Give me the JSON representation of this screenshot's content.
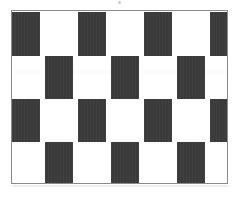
{
  "figure": {
    "caption": "",
    "frame": {
      "x": 11,
      "y": 10,
      "width": 217,
      "height": 174,
      "border_color": "#8a8a8a",
      "border_width": 1,
      "background_color": "#ffffff"
    }
  },
  "colors": {
    "block_dark": "#3a3a3a",
    "background_white": "#ffffff",
    "frame_line": "#8a8a8a",
    "page_background": "#ffffff",
    "shadow": "rgba(0,0,0,0.07)"
  },
  "pattern": {
    "type": "cafe-wall-checkerboard",
    "row_count": 4,
    "block_width": 28,
    "row_height": 43,
    "period": 66,
    "offset_even_rows": 33,
    "rows": [
      {
        "index": 1,
        "name": "row-1",
        "y": 1,
        "height": 44,
        "block_count": 4,
        "blocks": [
          {
            "x": 0,
            "width": 28
          },
          {
            "x": 66,
            "width": 28
          },
          {
            "x": 132,
            "width": 28
          },
          {
            "x": 198,
            "width": 18
          }
        ]
      },
      {
        "index": 2,
        "name": "row-2",
        "y": 45,
        "height": 43,
        "block_count": 3,
        "blocks": [
          {
            "x": 33,
            "width": 28
          },
          {
            "x": 99,
            "width": 28
          },
          {
            "x": 165,
            "width": 28
          }
        ]
      },
      {
        "index": 3,
        "name": "row-3",
        "y": 88,
        "height": 43,
        "block_count": 4,
        "blocks": [
          {
            "x": 0,
            "width": 28
          },
          {
            "x": 66,
            "width": 28
          },
          {
            "x": 132,
            "width": 28
          },
          {
            "x": 198,
            "width": 18
          }
        ]
      },
      {
        "index": 4,
        "name": "row-4",
        "y": 131,
        "height": 42,
        "block_count": 3,
        "blocks": [
          {
            "x": 33,
            "width": 28
          },
          {
            "x": 99,
            "width": 28
          },
          {
            "x": 165,
            "width": 28
          }
        ]
      }
    ],
    "shade_bands": [
      {
        "y": 58,
        "height": 6
      },
      {
        "y": 128,
        "height": 5
      }
    ]
  },
  "artifacts": {
    "top_speck": {
      "x": 118,
      "y": 1,
      "size": 3
    },
    "bottom_shadow": {
      "x": 13,
      "y": 185,
      "width": 216,
      "height": 2
    }
  }
}
